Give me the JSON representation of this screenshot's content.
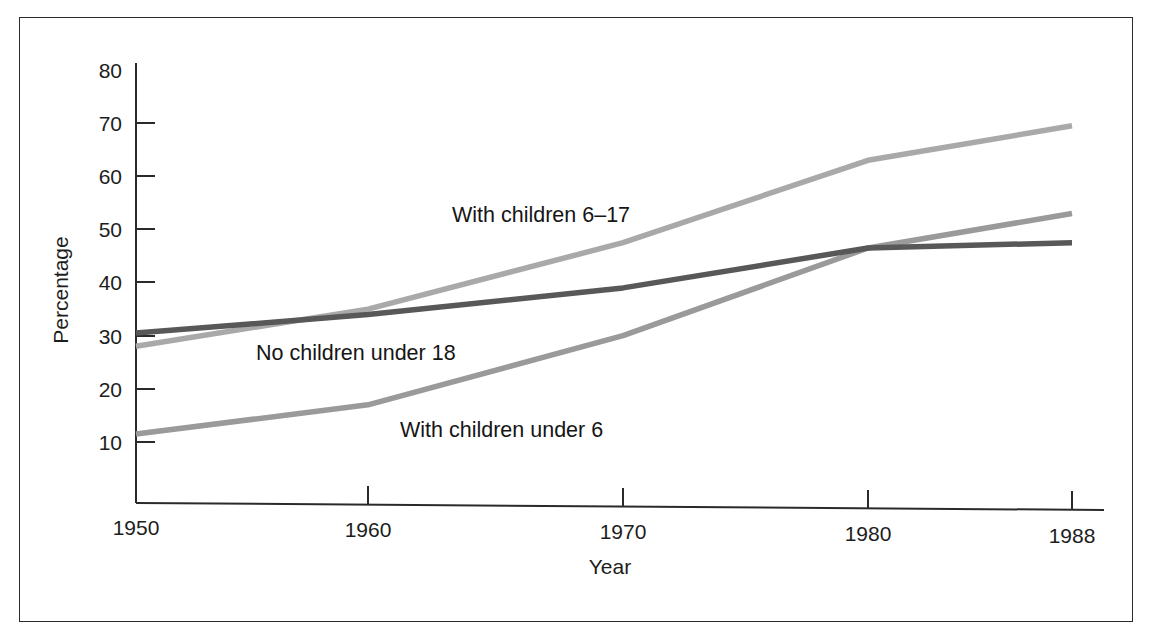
{
  "chart_data": {
    "type": "line",
    "title": "",
    "xlabel": "Year",
    "ylabel": "Percentage",
    "x": [
      1950,
      1960,
      1970,
      1980,
      1988
    ],
    "xtick_labels": [
      "1950",
      "1960",
      "1970",
      "1980",
      "1988"
    ],
    "ytick_labels": [
      "10",
      "20",
      "30",
      "40",
      "50",
      "60",
      "70",
      "80"
    ],
    "yticks": [
      10,
      20,
      30,
      40,
      50,
      60,
      70,
      80
    ],
    "xlim": [
      1950,
      1988
    ],
    "ylim": [
      0,
      80
    ],
    "grid": false,
    "legend_position": "inline-annotations",
    "series": [
      {
        "name": "With children 6-17",
        "label": "With children 6–17",
        "color": "#a9a9a9",
        "values": [
          28,
          35,
          47.5,
          63,
          69.5
        ]
      },
      {
        "name": "No children under 18",
        "label": "No children under 18",
        "color": "#585858",
        "values": [
          30.5,
          34,
          39,
          46.5,
          47.5
        ]
      },
      {
        "name": "With children under 6",
        "label": "With children under 6",
        "color": "#9a9a9a",
        "values": [
          11.5,
          17,
          30,
          46.5,
          53
        ]
      }
    ],
    "annotations": [
      {
        "text": "With children 6–17",
        "x": 1964.5,
        "y": 53
      },
      {
        "text": "No children under 18",
        "x": 1953.5,
        "y": 30.5
      },
      {
        "text": "With children under 6",
        "x": 1961.5,
        "y": 15.5
      }
    ]
  },
  "axes": {
    "y_title": "Percentage",
    "x_title": "Year",
    "ytick_labels": [
      "80",
      "70",
      "60",
      "50",
      "40",
      "30",
      "20",
      "10"
    ],
    "xtick_labels": [
      "1950",
      "1960",
      "1970",
      "1980",
      "1988"
    ]
  },
  "colors": {
    "frame": "#2b2b2b",
    "axis": "#2a2a2a",
    "background": "#ffffff",
    "series_dark": "#585858",
    "series_mid": "#9a9a9a",
    "series_light": "#a9a9a9"
  }
}
